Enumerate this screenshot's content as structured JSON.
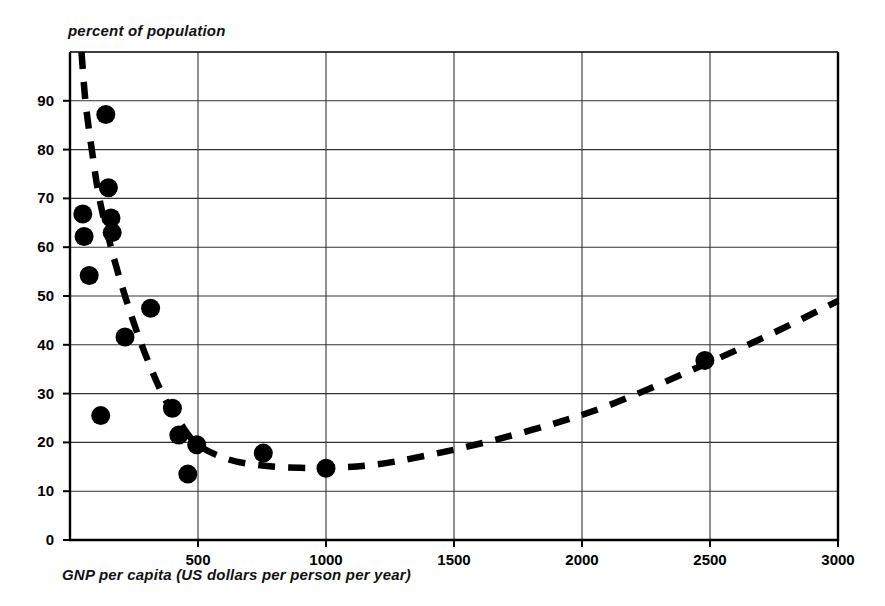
{
  "chart_data": {
    "type": "scatter",
    "title": "",
    "ylabel": "percent of population",
    "xlabel": "GNP per capita (US dollars per person per year)",
    "xlim": [
      0,
      3000
    ],
    "ylim": [
      0,
      100
    ],
    "grid": true,
    "legend": "none",
    "xticks": [
      "500",
      "1000",
      "1500",
      "2000",
      "2500",
      "3000"
    ],
    "xtick_values": [
      500,
      1000,
      1500,
      2000,
      2500,
      3000
    ],
    "yticks": [
      "0",
      "10",
      "20",
      "30",
      "40",
      "50",
      "60",
      "70",
      "80",
      "90"
    ],
    "ytick_values": [
      0,
      10,
      20,
      30,
      40,
      50,
      60,
      70,
      80,
      90
    ],
    "marker": "filled-circle",
    "marker_color": "#000000",
    "points": [
      {
        "x": 140,
        "y": 87.2
      },
      {
        "x": 150,
        "y": 72.2
      },
      {
        "x": 50,
        "y": 66.8
      },
      {
        "x": 160,
        "y": 66.0
      },
      {
        "x": 55,
        "y": 62.2
      },
      {
        "x": 165,
        "y": 63.0
      },
      {
        "x": 75,
        "y": 54.2
      },
      {
        "x": 315,
        "y": 47.5
      },
      {
        "x": 215,
        "y": 41.6
      },
      {
        "x": 120,
        "y": 25.5
      },
      {
        "x": 400,
        "y": 27.0
      },
      {
        "x": 425,
        "y": 21.5
      },
      {
        "x": 460,
        "y": 13.5
      },
      {
        "x": 495,
        "y": 19.5
      },
      {
        "x": 755,
        "y": 17.8
      },
      {
        "x": 1000,
        "y": 14.7
      },
      {
        "x": 2480,
        "y": 36.8
      }
    ],
    "trend_curve": {
      "style": "dashed",
      "color": "#000000",
      "points": [
        {
          "x": 45,
          "y": 100.0
        },
        {
          "x": 60,
          "y": 90.0
        },
        {
          "x": 85,
          "y": 80.0
        },
        {
          "x": 115,
          "y": 70.0
        },
        {
          "x": 160,
          "y": 60.0
        },
        {
          "x": 215,
          "y": 50.0
        },
        {
          "x": 280,
          "y": 40.0
        },
        {
          "x": 360,
          "y": 30.0
        },
        {
          "x": 430,
          "y": 24.0
        },
        {
          "x": 500,
          "y": 19.5
        },
        {
          "x": 620,
          "y": 16.5
        },
        {
          "x": 760,
          "y": 15.2
        },
        {
          "x": 900,
          "y": 14.8
        },
        {
          "x": 1000,
          "y": 14.8
        },
        {
          "x": 1200,
          "y": 15.5
        },
        {
          "x": 1500,
          "y": 18.5
        },
        {
          "x": 1800,
          "y": 22.5
        },
        {
          "x": 2100,
          "y": 27.5
        },
        {
          "x": 2480,
          "y": 36.0
        },
        {
          "x": 2750,
          "y": 42.5
        },
        {
          "x": 3000,
          "y": 49.0
        }
      ]
    }
  }
}
